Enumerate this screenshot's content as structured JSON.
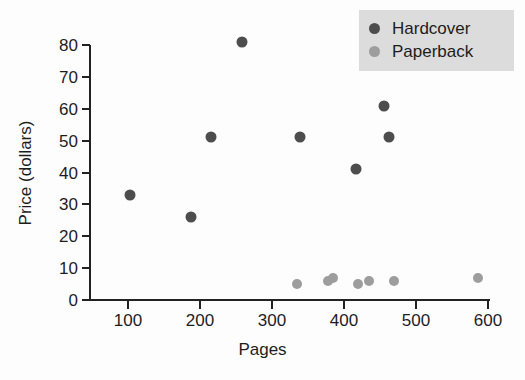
{
  "chart_data": {
    "type": "scatter",
    "title": "",
    "xlabel": "Pages",
    "ylabel": "Price (dollars)",
    "xlim": [
      55,
      615
    ],
    "ylim": [
      0,
      82
    ],
    "xticks": [
      100,
      200,
      300,
      400,
      500,
      600
    ],
    "yticks": [
      0,
      10,
      20,
      30,
      40,
      50,
      60,
      70,
      80
    ],
    "xtick_labels": [
      "100",
      "200",
      "300",
      "400",
      "500",
      "600"
    ],
    "ytick_labels": [
      "0",
      "10",
      "20",
      "30",
      "40",
      "50",
      "60",
      "70",
      "80"
    ],
    "grid": false,
    "legend_position": "top-right",
    "colors": {
      "hardcover": "#4d4d4d",
      "paperback": "#9d9d9d",
      "axis": "#222222",
      "legend_background": "#dcdcdc",
      "background": "#ffffff"
    },
    "series": [
      {
        "name": "Hardcover",
        "color": "#4d4d4d",
        "marker": "circle",
        "points": [
          {
            "x": 103,
            "y": 33
          },
          {
            "x": 187,
            "y": 26
          },
          {
            "x": 215,
            "y": 51
          },
          {
            "x": 259,
            "y": 81
          },
          {
            "x": 339,
            "y": 51
          },
          {
            "x": 417,
            "y": 41
          },
          {
            "x": 456,
            "y": 61
          },
          {
            "x": 462,
            "y": 51
          }
        ]
      },
      {
        "name": "Paperback",
        "color": "#9d9d9d",
        "marker": "circle",
        "points": [
          {
            "x": 335,
            "y": 5
          },
          {
            "x": 378,
            "y": 6
          },
          {
            "x": 385,
            "y": 7
          },
          {
            "x": 419,
            "y": 5
          },
          {
            "x": 435,
            "y": 6
          },
          {
            "x": 469,
            "y": 6
          },
          {
            "x": 586,
            "y": 7
          }
        ]
      }
    ]
  },
  "legend": {
    "entries": [
      {
        "label": "Hardcover",
        "key": "hardcover"
      },
      {
        "label": "Paperback",
        "key": "paperback"
      }
    ]
  }
}
